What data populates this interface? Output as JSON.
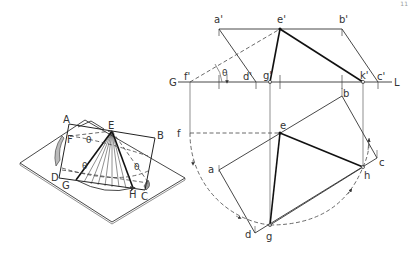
{
  "page_number": "11",
  "pictorial_view": {
    "labels": {
      "A": "A",
      "B": "B",
      "C": "C",
      "D": "D",
      "E": "E",
      "F": "F",
      "G": "G",
      "H": "H",
      "theta1": "θ",
      "theta2": "θ",
      "theta3": "θ"
    }
  },
  "front_view": {
    "ground_line_left": "G",
    "ground_line_right": "L",
    "labels": {
      "a_prime": "a'",
      "e_prime": "e'",
      "b_prime": "b'",
      "f_prime": "f'",
      "d_prime": "d'",
      "g_prime": "g'",
      "k_prime": "k'",
      "c_prime": "c'",
      "theta": "θ"
    }
  },
  "top_view": {
    "labels": {
      "a": "a",
      "b": "b",
      "c": "c",
      "d": "d",
      "e": "e",
      "f": "f",
      "g": "g",
      "h": "h"
    }
  }
}
